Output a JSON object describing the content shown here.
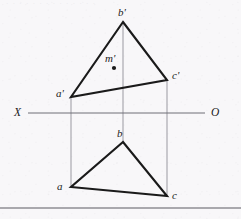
{
  "figure": {
    "type": "descriptive-geometry-orthographic-projection",
    "width": 241,
    "height": 219,
    "background_color": "#f8f7f9",
    "stroke_color": "#1a1a1a",
    "projector_color": "#8a8a92",
    "axis_color": "#6e6e76",
    "rule_color": "#5a5a62",
    "header_smudge_text": "· · · · · · · · · · · · · ·"
  },
  "axis": {
    "left_label": "X",
    "right_label": "O",
    "y": 113,
    "x_start": 28,
    "x_end": 205,
    "left_label_pos": {
      "x": 14,
      "y": 107
    },
    "right_label_pos": {
      "x": 211,
      "y": 107
    }
  },
  "frontal_view": {
    "name": "frontal-projection-triangle",
    "vertices": [
      {
        "id": "b-prime",
        "label": "b'",
        "x": 123,
        "y": 22,
        "label_x": 118,
        "label_y": 7
      },
      {
        "id": "c-prime",
        "label": "c'",
        "x": 167,
        "y": 80,
        "label_x": 172,
        "label_y": 70
      },
      {
        "id": "a-prime",
        "label": "a'",
        "x": 71,
        "y": 97,
        "label_x": 56,
        "label_y": 88
      }
    ],
    "interior_point": {
      "id": "m-prime",
      "label": "m'",
      "x": 114,
      "y": 68,
      "label_x": 105,
      "label_y": 53,
      "dot_radius": 2.1
    }
  },
  "horizontal_view": {
    "name": "horizontal-projection-triangle",
    "vertices": [
      {
        "id": "b",
        "label": "b",
        "x": 123,
        "y": 142,
        "label_x": 117,
        "label_y": 128
      },
      {
        "id": "c",
        "label": "c",
        "x": 167,
        "y": 196,
        "label_x": 172,
        "label_y": 190
      },
      {
        "id": "a",
        "label": "a",
        "x": 71,
        "y": 187,
        "label_x": 57,
        "label_y": 181
      }
    ]
  },
  "projectors": [
    {
      "id": "projector-a",
      "x": 71,
      "y_top": 97,
      "y_bottom": 187
    },
    {
      "id": "projector-b",
      "x": 123,
      "y_top": 22,
      "y_bottom": 142
    },
    {
      "id": "projector-c",
      "x": 167,
      "y_top": 80,
      "y_bottom": 196
    }
  ],
  "bottom_rule": {
    "id": "page-bottom-rule",
    "y": 208,
    "x_start": 0,
    "x_end": 241
  }
}
